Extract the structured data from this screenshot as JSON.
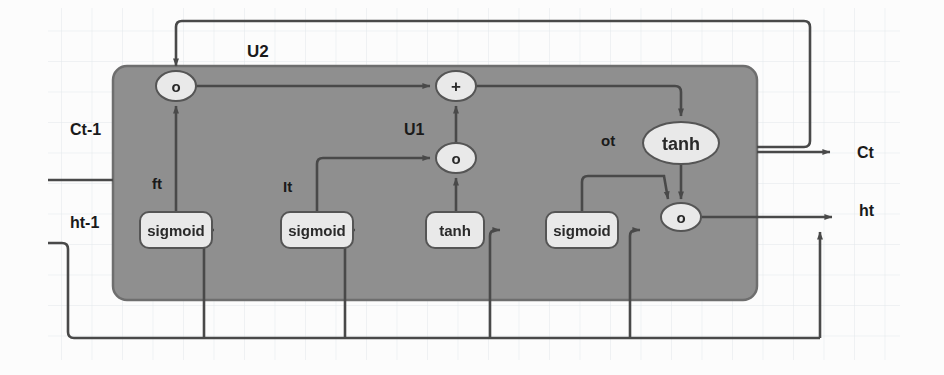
{
  "diagram": {
    "background_color": "#fbfbfb",
    "grid_color": "#d8dfe4",
    "cell_fill": "#8f8f8f",
    "cell_stroke": "#6d6d6d",
    "node_fill": "#e9e9e9",
    "node_stroke": "#5a5a5a",
    "line_color": "#4a4a4a",
    "text_color": "#1e1e1e"
  },
  "io_labels": {
    "c_prev": "Ct-1",
    "h_prev": "ht-1",
    "c_out": "Ct",
    "h_out": "ht"
  },
  "path_labels": {
    "u2": "U2",
    "u1": "U1",
    "forget": "ft",
    "input": "It",
    "output": "ot"
  },
  "gates": [
    {
      "id": "forget-gate",
      "label": "sigmoid",
      "x": 140,
      "y": 212,
      "w": 72,
      "h": 36
    },
    {
      "id": "input-gate",
      "label": "sigmoid",
      "x": 281,
      "y": 212,
      "w": 72,
      "h": 36
    },
    {
      "id": "candidate-gate",
      "label": "tanh",
      "x": 426,
      "y": 212,
      "w": 58,
      "h": 36
    },
    {
      "id": "output-gate",
      "label": "sigmoid",
      "x": 546,
      "y": 212,
      "w": 72,
      "h": 36
    }
  ],
  "operators": [
    {
      "id": "forget-multiply-op",
      "symbol": "o",
      "cx": 176,
      "cy": 86,
      "rx": 20,
      "ry": 15
    },
    {
      "id": "state-add-op",
      "symbol": "+",
      "cx": 456,
      "cy": 86,
      "rx": 20,
      "ry": 15
    },
    {
      "id": "input-multiply-op",
      "symbol": "o",
      "cx": 456,
      "cy": 158,
      "rx": 20,
      "ry": 15
    },
    {
      "id": "output-multiply-op",
      "symbol": "o",
      "cx": 681,
      "cy": 217,
      "rx": 20,
      "ry": 14
    }
  ],
  "activation_nodes": [
    {
      "id": "cell-tanh-node",
      "label": "tanh",
      "cx": 681,
      "cy": 143,
      "rx": 38,
      "ry": 21
    }
  ],
  "cell_body": {
    "x": 113,
    "y": 66,
    "w": 644,
    "h": 234,
    "r": 14
  }
}
